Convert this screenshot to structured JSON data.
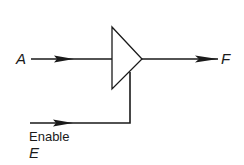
{
  "diagram": {
    "type": "tri-state buffer",
    "input_label": "A",
    "output_label": "F",
    "enable_label_line1": "Enable",
    "enable_label_line2": "E",
    "line_color": "#1a1a1a",
    "background_color": "#ffffff"
  }
}
